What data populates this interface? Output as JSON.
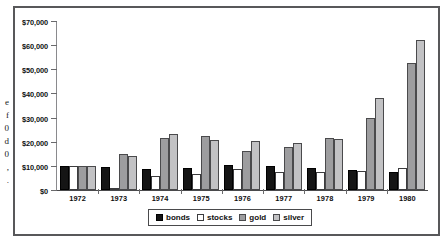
{
  "left_margin_fragment": {
    "lines": [
      "e",
      "f",
      "0",
      "d",
      "0",
      ",",
      "."
    ]
  },
  "legend": {
    "position": "bottom-center",
    "items": [
      {
        "label": "bonds",
        "key": "bonds",
        "color": "#151515"
      },
      {
        "label": "stocks",
        "key": "stocks",
        "color": "#ffffff"
      },
      {
        "label": "gold",
        "key": "gold",
        "color": "#9d9d9f"
      },
      {
        "label": "silver",
        "key": "silver",
        "color": "#c2c2c4"
      }
    ]
  },
  "chart_data": {
    "type": "bar",
    "title": "",
    "xlabel": "",
    "ylabel": "",
    "grid": false,
    "legend_position": "bottom-center",
    "ylim": [
      0,
      70000
    ],
    "ytick_step": 10000,
    "ytick_labels": [
      "$0",
      "$10,000",
      "$20,000",
      "$30,000",
      "$40,000",
      "$50,000",
      "$60,000",
      "$70,000"
    ],
    "ytick_values": [
      0,
      10000,
      20000,
      30000,
      40000,
      50000,
      60000,
      70000
    ],
    "categories": [
      "1972",
      "1973",
      "1974",
      "1975",
      "1976",
      "1977",
      "1978",
      "1979",
      "1980"
    ],
    "series": [
      {
        "name": "bonds",
        "color": "#151515",
        "values": [
          10000,
          9700,
          8600,
          9100,
          10400,
          9900,
          9200,
          8400,
          7500
        ]
      },
      {
        "name": "stocks",
        "color": "#ffffff",
        "values": [
          10000,
          300,
          5600,
          6700,
          8700,
          7400,
          7400,
          7900,
          9200
        ]
      },
      {
        "name": "gold",
        "color": "#9d9d9f",
        "values": [
          10000,
          14900,
          21600,
          22300,
          16100,
          17900,
          21700,
          30000,
          52500
        ]
      },
      {
        "name": "silver",
        "color": "#c2c2c4",
        "values": [
          10000,
          14200,
          23300,
          20800,
          20100,
          19600,
          21200,
          38300,
          62200
        ]
      }
    ]
  }
}
